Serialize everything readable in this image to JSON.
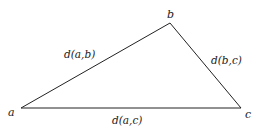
{
  "diagram": {
    "type": "triangle",
    "vertices": [
      {
        "id": "a",
        "label": "a",
        "x": 21,
        "y": 108
      },
      {
        "id": "b",
        "label": "b",
        "x": 170,
        "y": 23
      },
      {
        "id": "c",
        "label": "c",
        "x": 241,
        "y": 108
      }
    ],
    "edges": [
      {
        "from": "a",
        "to": "b",
        "label": "d(a,b)"
      },
      {
        "from": "b",
        "to": "c",
        "label": "d(b,c)"
      },
      {
        "from": "a",
        "to": "c",
        "label": "d(a,c)"
      }
    ],
    "colors": {
      "stroke": "#222222",
      "text": "#1a1a1a",
      "background": "#ffffff"
    }
  }
}
